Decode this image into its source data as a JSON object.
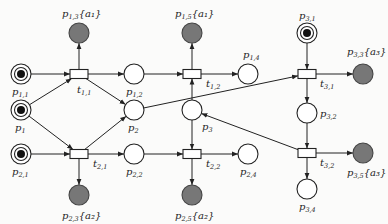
{
  "diagram": {
    "type": "petri-net",
    "places": [
      {
        "id": "p11",
        "main": "p",
        "sub": "1,1",
        "suffix": "",
        "cx": 21,
        "cy": 74,
        "token": true,
        "final": false,
        "lx": 12,
        "ly": 95
      },
      {
        "id": "p1",
        "main": "p",
        "sub": "1",
        "suffix": "",
        "cx": 21,
        "cy": 110,
        "token": true,
        "final": false,
        "lx": 15,
        "ly": 131
      },
      {
        "id": "p21",
        "main": "p",
        "sub": "2,1",
        "suffix": "",
        "cx": 21,
        "cy": 154,
        "token": true,
        "final": false,
        "lx": 12,
        "ly": 175
      },
      {
        "id": "p13",
        "main": "p",
        "sub": "1,3",
        "suffix": "{a₁}",
        "cx": 79,
        "cy": 33,
        "token": false,
        "final": true,
        "lx": 62,
        "ly": 17
      },
      {
        "id": "p23",
        "main": "p",
        "sub": "2,3",
        "suffix": "{a₂}",
        "cx": 79,
        "cy": 195,
        "token": false,
        "final": true,
        "lx": 62,
        "ly": 219
      },
      {
        "id": "p12",
        "main": "p",
        "sub": "1,2",
        "suffix": "",
        "cx": 134,
        "cy": 74,
        "token": false,
        "final": false,
        "lx": 126,
        "ly": 95
      },
      {
        "id": "p2",
        "main": "p",
        "sub": "2",
        "suffix": "",
        "cx": 134,
        "cy": 110,
        "token": false,
        "final": false,
        "lx": 128,
        "ly": 131
      },
      {
        "id": "p22",
        "main": "p",
        "sub": "2,2",
        "suffix": "",
        "cx": 134,
        "cy": 154,
        "token": false,
        "final": false,
        "lx": 126,
        "ly": 175
      },
      {
        "id": "p15",
        "main": "p",
        "sub": "1,5",
        "suffix": "{a₁}",
        "cx": 192,
        "cy": 33,
        "token": false,
        "final": true,
        "lx": 175,
        "ly": 17
      },
      {
        "id": "p3",
        "main": "p",
        "sub": "3",
        "suffix": "",
        "cx": 192,
        "cy": 110,
        "token": false,
        "final": false,
        "lx": 202,
        "ly": 130
      },
      {
        "id": "p25",
        "main": "p",
        "sub": "2,5",
        "suffix": "{a₂}",
        "cx": 192,
        "cy": 195,
        "token": false,
        "final": true,
        "lx": 175,
        "ly": 219
      },
      {
        "id": "p14",
        "main": "p",
        "sub": "1,4",
        "suffix": "",
        "cx": 248,
        "cy": 74,
        "token": false,
        "final": false,
        "lx": 243,
        "ly": 58
      },
      {
        "id": "p24",
        "main": "p",
        "sub": "2,4",
        "suffix": "",
        "cx": 248,
        "cy": 154,
        "token": false,
        "final": false,
        "lx": 240,
        "ly": 175
      },
      {
        "id": "p31",
        "main": "p",
        "sub": "3,1",
        "suffix": "",
        "cx": 307,
        "cy": 33,
        "token": true,
        "final": false,
        "lx": 299,
        "ly": 19
      },
      {
        "id": "p33",
        "main": "p",
        "sub": "3,3",
        "suffix": "{a₃}",
        "cx": 363,
        "cy": 74,
        "token": false,
        "final": true,
        "lx": 347,
        "ly": 55
      },
      {
        "id": "p32",
        "main": "p",
        "sub": "3,2",
        "suffix": "",
        "cx": 307,
        "cy": 113,
        "token": false,
        "final": false,
        "lx": 320,
        "ly": 117
      },
      {
        "id": "p35",
        "main": "p",
        "sub": "3,5",
        "suffix": "{a₃}",
        "cx": 363,
        "cy": 153,
        "token": false,
        "final": true,
        "lx": 347,
        "ly": 176
      },
      {
        "id": "p34",
        "main": "p",
        "sub": "3,4",
        "suffix": "",
        "cx": 307,
        "cy": 189,
        "token": false,
        "final": false,
        "lx": 299,
        "ly": 210
      }
    ],
    "transitions": [
      {
        "id": "t11",
        "main": "t",
        "sub": "1,1",
        "cx": 79,
        "cy": 74,
        "lx": 77,
        "ly": 93
      },
      {
        "id": "t21",
        "main": "t",
        "sub": "2,1",
        "cx": 79,
        "cy": 154,
        "lx": 93,
        "ly": 167
      },
      {
        "id": "t12",
        "main": "t",
        "sub": "1,2",
        "cx": 192,
        "cy": 74,
        "lx": 206,
        "ly": 87
      },
      {
        "id": "t22",
        "main": "t",
        "sub": "2,2",
        "cx": 192,
        "cy": 154,
        "lx": 206,
        "ly": 167
      },
      {
        "id": "t31",
        "main": "t",
        "sub": "3,1",
        "cx": 307,
        "cy": 74,
        "lx": 320,
        "ly": 87
      },
      {
        "id": "t32",
        "main": "t",
        "sub": "3,2",
        "cx": 307,
        "cy": 153,
        "lx": 320,
        "ly": 166
      }
    ],
    "arcs": [
      {
        "from": "p11",
        "to": "t11"
      },
      {
        "from": "p1",
        "to": "t11"
      },
      {
        "from": "p1",
        "to": "t21"
      },
      {
        "from": "p21",
        "to": "t21"
      },
      {
        "from": "t11",
        "to": "p13"
      },
      {
        "from": "t11",
        "to": "p12"
      },
      {
        "from": "t11",
        "to": "p2"
      },
      {
        "from": "t21",
        "to": "p2"
      },
      {
        "from": "t21",
        "to": "p22"
      },
      {
        "from": "t21",
        "to": "p23"
      },
      {
        "from": "p12",
        "to": "t12"
      },
      {
        "from": "p3",
        "to": "t12"
      },
      {
        "from": "p3",
        "to": "t22"
      },
      {
        "from": "p22",
        "to": "t22"
      },
      {
        "from": "t12",
        "to": "p15"
      },
      {
        "from": "t12",
        "to": "p14"
      },
      {
        "from": "t22",
        "to": "p24"
      },
      {
        "from": "t22",
        "to": "p25"
      },
      {
        "from": "p2",
        "to": "t31"
      },
      {
        "from": "p31",
        "to": "t31"
      },
      {
        "from": "t31",
        "to": "p33"
      },
      {
        "from": "t31",
        "to": "p32"
      },
      {
        "from": "p32",
        "to": "t32"
      },
      {
        "from": "t32",
        "to": "p35"
      },
      {
        "from": "t32",
        "to": "p34"
      },
      {
        "from": "t32",
        "to": "p3"
      }
    ],
    "colors": {
      "stroke": "#222222",
      "final_fill": "#777777",
      "token": "#111111",
      "background": "#fbfbfa"
    }
  }
}
